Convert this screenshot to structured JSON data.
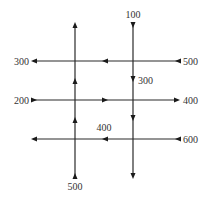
{
  "diagram": {
    "type": "traffic-flow-grid",
    "colors": {
      "line": "#2a2a2a",
      "label": "#333333",
      "background": "#ffffff"
    },
    "vertical_streets": [
      {
        "id": "left",
        "direction": "up",
        "label": "500",
        "label_position": "bottom"
      },
      {
        "id": "right",
        "direction": "down",
        "label": "100",
        "label_position": "top"
      }
    ],
    "horizontal_streets": [
      {
        "id": "top",
        "direction": "left",
        "left_label": "300",
        "right_label": "500"
      },
      {
        "id": "middle",
        "direction": "right",
        "left_label": "200",
        "right_label": "400"
      },
      {
        "id": "bottom",
        "direction": "left",
        "left_label": "",
        "right_label": "600"
      }
    ],
    "internal_labels": [
      {
        "id": "right-vertical-middle",
        "text": "300"
      },
      {
        "id": "bottom-horizontal-middle",
        "text": "400"
      }
    ]
  }
}
